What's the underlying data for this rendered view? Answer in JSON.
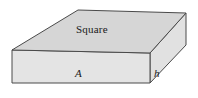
{
  "figure": {
    "name": "rectangular-slab-solid",
    "canvas": {
      "width": 198,
      "height": 98,
      "background": "#ffffff"
    },
    "stroke": {
      "color": "#4a4a4a",
      "width": 1
    },
    "faces": {
      "top": {
        "label": "Square",
        "fill": "#d6d6d6",
        "label_position": {
          "x": 76,
          "y": 24
        },
        "points": "12,50 78,10 186,13 150,53"
      },
      "front": {
        "label": "A",
        "fill": "#e4e4e4",
        "label_position": {
          "x": 75,
          "y": 68
        },
        "points": "12,50 150,53 150,83 12,83"
      },
      "side": {
        "label": "h",
        "fill": "#e1e1e1",
        "label_position": {
          "x": 154,
          "y": 68
        },
        "points": "150,53 186,13 186,45 150,83"
      }
    }
  }
}
